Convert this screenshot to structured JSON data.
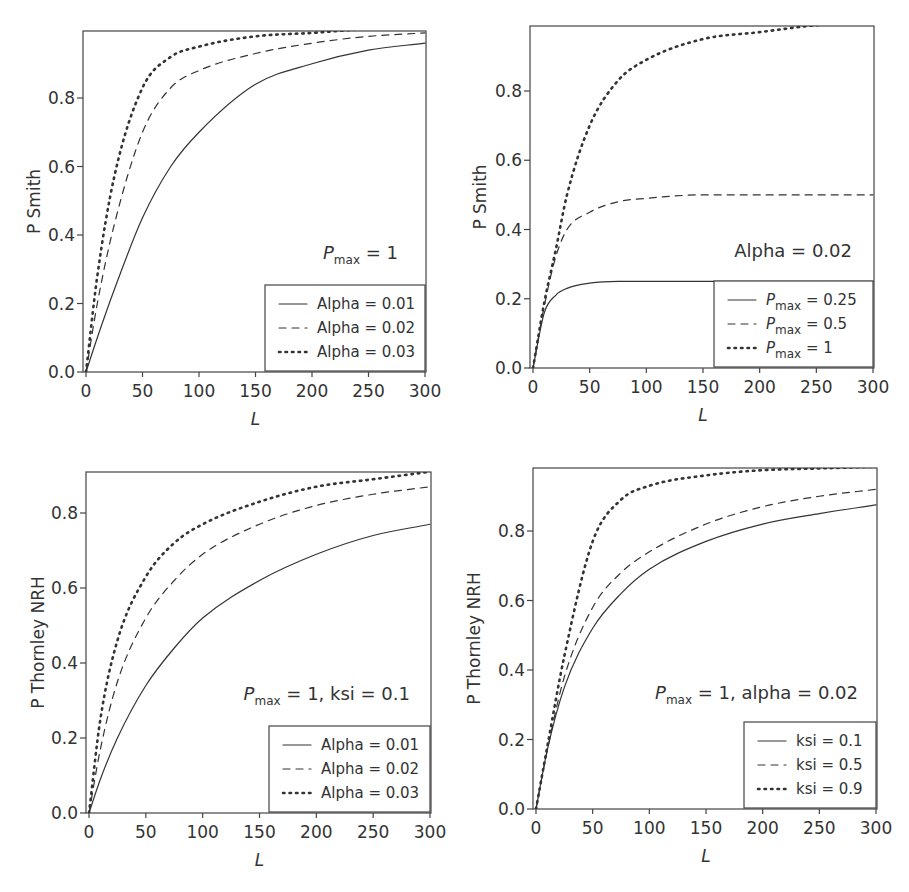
{
  "chart_data": [
    {
      "type": "line",
      "panel": "top-left",
      "xlabel": "L",
      "ylabel": "P Smith",
      "xlim": [
        0,
        300
      ],
      "ylim": [
        0,
        1.0
      ],
      "xticks": [
        "0",
        "50",
        "100",
        "150",
        "200",
        "250",
        "300"
      ],
      "yticks": [
        "0.0",
        "0.2",
        "0.4",
        "0.6",
        "0.8"
      ],
      "annotation": {
        "main": "P",
        "sub": "max",
        "rest": " = 1"
      },
      "legend_position": "lower right",
      "x": [
        0,
        10,
        25,
        50,
        75,
        100,
        150,
        200,
        250,
        300
      ],
      "series": [
        {
          "name": "Alpha = 0.01",
          "style": "solid",
          "values": [
            0,
            0.1,
            0.24,
            0.45,
            0.6,
            0.7,
            0.84,
            0.9,
            0.94,
            0.96
          ]
        },
        {
          "name": "Alpha = 0.02",
          "style": "dashed",
          "values": [
            0,
            0.2,
            0.43,
            0.7,
            0.83,
            0.88,
            0.93,
            0.96,
            0.98,
            0.99
          ]
        },
        {
          "name": "Alpha = 0.03",
          "style": "dotted",
          "values": [
            0,
            0.28,
            0.57,
            0.83,
            0.92,
            0.95,
            0.98,
            0.99,
            1.0,
            1.0
          ]
        }
      ]
    },
    {
      "type": "line",
      "panel": "top-right",
      "xlabel": "L",
      "ylabel": "P Smith",
      "xlim": [
        0,
        300
      ],
      "ylim": [
        0,
        1.0
      ],
      "xticks": [
        "0",
        "50",
        "100",
        "150",
        "200",
        "250",
        "300"
      ],
      "yticks": [
        "0.0",
        "0.2",
        "0.4",
        "0.6",
        "0.8"
      ],
      "annotation": {
        "main": "Alpha = 0.02",
        "sub": "",
        "rest": ""
      },
      "legend_position": "lower right",
      "x": [
        0,
        10,
        20,
        30,
        50,
        75,
        100,
        150,
        200,
        250,
        300
      ],
      "series": [
        {
          "name": "Pmax = 0.25",
          "style": "solid",
          "values": [
            0,
            0.16,
            0.21,
            0.23,
            0.245,
            0.25,
            0.25,
            0.25,
            0.25,
            0.25,
            0.25
          ]
        },
        {
          "name": "Pmax = 0.5",
          "style": "dashed",
          "values": [
            0,
            0.18,
            0.32,
            0.4,
            0.45,
            0.48,
            0.49,
            0.5,
            0.5,
            0.5,
            0.5
          ]
        },
        {
          "name": "Pmax = 1",
          "style": "dotted",
          "values": [
            0,
            0.19,
            0.34,
            0.5,
            0.7,
            0.83,
            0.89,
            0.95,
            0.97,
            0.99,
            1.0
          ]
        }
      ],
      "legend_labels": [
        {
          "main": "P",
          "sub": "max",
          "rest": " = 0.25"
        },
        {
          "main": "P",
          "sub": "max",
          "rest": " = 0.5"
        },
        {
          "main": "P",
          "sub": "max",
          "rest": " = 1"
        }
      ]
    },
    {
      "type": "line",
      "panel": "bottom-left",
      "xlabel": "L",
      "ylabel": "P Thornley NRH",
      "xlim": [
        0,
        300
      ],
      "ylim": [
        0,
        0.9
      ],
      "xticks": [
        "0",
        "50",
        "100",
        "150",
        "200",
        "250",
        "300"
      ],
      "yticks": [
        "0.0",
        "0.2",
        "0.4",
        "0.6",
        "0.8"
      ],
      "annotation": {
        "main": "P",
        "sub": "max",
        "rest": " = 1, ksi = 0.1"
      },
      "legend_position": "lower right",
      "x": [
        0,
        10,
        25,
        50,
        75,
        100,
        150,
        200,
        250,
        300
      ],
      "series": [
        {
          "name": "Alpha = 0.01",
          "style": "solid",
          "values": [
            0,
            0.09,
            0.2,
            0.34,
            0.44,
            0.52,
            0.62,
            0.69,
            0.74,
            0.77
          ]
        },
        {
          "name": "Alpha = 0.02",
          "style": "dashed",
          "values": [
            0,
            0.17,
            0.35,
            0.52,
            0.62,
            0.69,
            0.77,
            0.82,
            0.85,
            0.87
          ]
        },
        {
          "name": "Alpha = 0.03",
          "style": "dotted",
          "values": [
            0,
            0.25,
            0.46,
            0.63,
            0.72,
            0.77,
            0.83,
            0.87,
            0.89,
            0.91
          ]
        }
      ]
    },
    {
      "type": "line",
      "panel": "bottom-right",
      "xlabel": "L",
      "ylabel": "P Thornley NRH",
      "xlim": [
        0,
        300
      ],
      "ylim": [
        0,
        0.98
      ],
      "xticks": [
        "0",
        "50",
        "100",
        "150",
        "200",
        "250",
        "300"
      ],
      "yticks": [
        "0.0",
        "0.2",
        "0.4",
        "0.6",
        "0.8"
      ],
      "annotation": {
        "main": "P",
        "sub": "max",
        "rest": " = 1, alpha = 0.02"
      },
      "legend_position": "lower right",
      "x": [
        0,
        10,
        25,
        50,
        75,
        100,
        150,
        200,
        250,
        300
      ],
      "series": [
        {
          "name": "ksi = 0.1",
          "style": "solid",
          "values": [
            0,
            0.17,
            0.35,
            0.52,
            0.62,
            0.69,
            0.77,
            0.82,
            0.85,
            0.875
          ]
        },
        {
          "name": "ksi = 0.5",
          "style": "dashed",
          "values": [
            0,
            0.17,
            0.38,
            0.58,
            0.68,
            0.74,
            0.82,
            0.87,
            0.9,
            0.92
          ]
        },
        {
          "name": "ksi = 0.9",
          "style": "dotted",
          "values": [
            0,
            0.18,
            0.44,
            0.77,
            0.89,
            0.93,
            0.96,
            0.975,
            0.98,
            0.985
          ]
        }
      ]
    }
  ]
}
